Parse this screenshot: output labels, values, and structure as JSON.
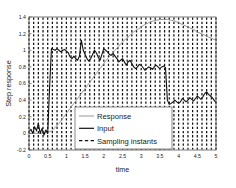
{
  "figure": {
    "background_color": "#ffffff",
    "plot_area": {
      "left": 29,
      "top": 17,
      "right": 216,
      "bottom": 150
    },
    "axes_color": "#000000"
  },
  "axes": {
    "xlabel": "time",
    "ylabel": "Step response",
    "xticks": [
      "0",
      "0.5",
      "1",
      "1.5",
      "2",
      "2.5",
      "3",
      "3.5",
      "4",
      "4.5",
      "5"
    ],
    "xtick_values": [
      0,
      0.5,
      1,
      1.5,
      2,
      2.5,
      3,
      3.5,
      4,
      4.5,
      5
    ],
    "yticks": [
      "-0.2",
      "0",
      "0.2",
      "0.4",
      "0.6",
      "0.8",
      "1",
      "1.2",
      "1.4"
    ],
    "ytick_values": [
      -0.2,
      0,
      0.2,
      0.4,
      0.6,
      0.8,
      1,
      1.2,
      1.4
    ],
    "xlim": [
      0,
      5
    ],
    "ylim": [
      -0.2,
      1.4
    ]
  },
  "legend": {
    "position": "lower-center",
    "box": {
      "x": 75,
      "y": 107,
      "width": 97,
      "height": 42
    },
    "entries": [
      {
        "label": "Response",
        "style": "solid-thin",
        "color": "#8c8c8c",
        "sample": "line"
      },
      {
        "label": "Input",
        "style": "solid-thick",
        "color": "#111111",
        "sample": "line"
      },
      {
        "label": "Sampling instants",
        "style": "dashed",
        "color": "#111111",
        "sample": "dashed-line"
      }
    ]
  },
  "chart_data": {
    "type": "line",
    "title": "",
    "xlabel": "time",
    "ylabel": "Step response",
    "xlim": [
      0,
      5
    ],
    "ylim": [
      -0.2,
      1.4
    ],
    "grid": false,
    "legend_position": "lower-center",
    "sampling_instants": {
      "description": "Vertical dashed lines marking discrete sampling times",
      "interval": 0.125,
      "count": 41,
      "color": "#111111",
      "values": [
        0,
        0.125,
        0.25,
        0.375,
        0.5,
        0.625,
        0.75,
        0.875,
        1,
        1.125,
        1.25,
        1.375,
        1.5,
        1.625,
        1.75,
        1.875,
        2,
        2.125,
        2.25,
        2.375,
        2.5,
        2.625,
        2.75,
        2.875,
        3,
        3.125,
        3.25,
        3.375,
        3.5,
        3.625,
        3.75,
        3.875,
        4,
        4.125,
        4.25,
        4.375,
        4.5,
        4.625,
        4.75,
        4.875,
        5
      ]
    },
    "series": [
      {
        "name": "Input",
        "color": "#111111",
        "linewidth": 1.1,
        "x": [
          0,
          0.05,
          0.1,
          0.15,
          0.2,
          0.25,
          0.3,
          0.35,
          0.4,
          0.45,
          0.5,
          0.55,
          0.6,
          0.65,
          0.7,
          0.75,
          0.8,
          0.85,
          0.9,
          0.95,
          1.0,
          1.05,
          1.1,
          1.15,
          1.2,
          1.25,
          1.3,
          1.35,
          1.4,
          1.45,
          1.5,
          1.55,
          1.6,
          1.65,
          1.7,
          1.75,
          1.8,
          1.85,
          1.9,
          1.95,
          2.0,
          2.05,
          2.1,
          2.15,
          2.2,
          2.25,
          2.3,
          2.35,
          2.4,
          2.45,
          2.5,
          2.55,
          2.6,
          2.65,
          2.7,
          2.75,
          2.8,
          2.85,
          2.9,
          2.95,
          3.0,
          3.05,
          3.1,
          3.15,
          3.2,
          3.25,
          3.3,
          3.35,
          3.4,
          3.45,
          3.5,
          3.55,
          3.6,
          3.65,
          3.7,
          3.75,
          3.8,
          3.85,
          3.9,
          3.95,
          4.0,
          4.05,
          4.1,
          4.15,
          4.2,
          4.25,
          4.3,
          4.35,
          4.4,
          4.45,
          4.5,
          4.55,
          4.6,
          4.65,
          4.7,
          4.75,
          4.8,
          4.85,
          4.9,
          4.95,
          5.0
        ],
        "y": [
          0.02,
          0.05,
          0.0,
          0.08,
          0.03,
          0.12,
          0.0,
          0.06,
          -0.02,
          0.04,
          0.0,
          0.55,
          1.02,
          1.01,
          1.0,
          1.02,
          1.0,
          0.98,
          1.0,
          1.01,
          0.99,
          0.97,
          0.92,
          0.9,
          0.93,
          0.9,
          0.88,
          0.93,
          1.12,
          1.0,
          0.95,
          0.9,
          0.87,
          0.9,
          0.95,
          1.0,
          0.97,
          0.92,
          0.88,
          0.95,
          1.02,
          1.0,
          0.98,
          0.95,
          0.94,
          0.96,
          0.93,
          0.9,
          0.86,
          0.88,
          0.9,
          0.86,
          0.82,
          0.86,
          0.88,
          0.84,
          0.8,
          0.78,
          0.8,
          0.83,
          0.82,
          0.79,
          0.76,
          0.78,
          0.8,
          0.79,
          0.77,
          0.8,
          0.82,
          0.8,
          0.78,
          0.8,
          0.81,
          0.79,
          0.4,
          0.35,
          0.36,
          0.38,
          0.4,
          0.38,
          0.36,
          0.38,
          0.42,
          0.4,
          0.38,
          0.4,
          0.43,
          0.41,
          0.39,
          0.42,
          0.45,
          0.43,
          0.41,
          0.44,
          0.48,
          0.5,
          0.47,
          0.45,
          0.43,
          0.4,
          0.37
        ]
      },
      {
        "name": "Response",
        "color": "#8c8c8c",
        "linewidth": 0.9,
        "x": [
          0,
          0.1,
          0.2,
          0.3,
          0.4,
          0.5,
          0.6,
          0.7,
          0.8,
          0.9,
          1.0,
          1.1,
          1.2,
          1.3,
          1.4,
          1.5,
          1.6,
          1.7,
          1.8,
          1.9,
          2.0,
          2.1,
          2.2,
          2.3,
          2.4,
          2.5,
          2.6,
          2.7,
          2.8,
          2.9,
          3.0,
          3.1,
          3.2,
          3.3,
          3.4,
          3.5,
          3.6,
          3.7,
          3.8,
          3.9,
          4.0,
          4.1,
          4.2,
          4.3,
          4.4,
          4.5,
          4.6,
          4.7,
          4.8,
          4.9,
          5.0
        ],
        "y": [
          0.0,
          0.0,
          0.0,
          0.0,
          0.0,
          0.01,
          0.03,
          0.07,
          0.12,
          0.18,
          0.24,
          0.3,
          0.36,
          0.42,
          0.48,
          0.54,
          0.6,
          0.66,
          0.72,
          0.78,
          0.84,
          0.9,
          0.95,
          1.0,
          1.05,
          1.1,
          1.14,
          1.18,
          1.22,
          1.25,
          1.28,
          1.31,
          1.33,
          1.35,
          1.36,
          1.37,
          1.37,
          1.37,
          1.36,
          1.35,
          1.33,
          1.31,
          1.29,
          1.27,
          1.25,
          1.22,
          1.2,
          1.18,
          1.16,
          1.14,
          1.12
        ]
      }
    ]
  }
}
